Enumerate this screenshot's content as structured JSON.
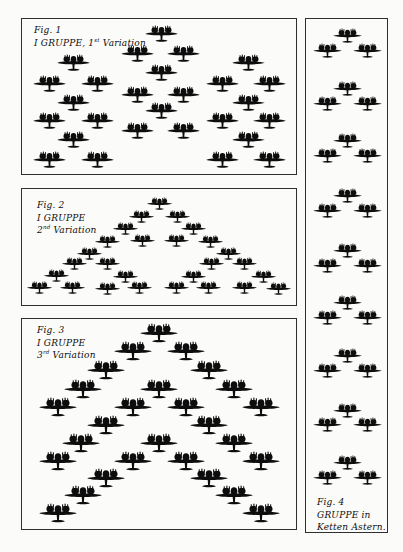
{
  "page": {
    "width": 403,
    "height": 552,
    "background": "#fbfbf9",
    "ink": "#0d0d0d",
    "box_border": "#2f2f2f"
  },
  "figures": [
    {
      "name": "fig-1-gruppe-1st-variation",
      "box": {
        "x": 21,
        "y": 18,
        "w": 276,
        "h": 157
      },
      "caption": {
        "x": 12,
        "y": 5,
        "line1": "Fig. 1",
        "line2_pre": "I GRUPPE, 1",
        "line2_sup": "st",
        "line2_post": " Variation"
      },
      "plane_width": 33,
      "planes": [
        [
          160,
          33
        ],
        [
          136,
          53
        ],
        [
          182,
          53
        ],
        [
          160,
          72
        ],
        [
          136,
          94
        ],
        [
          182,
          94
        ],
        [
          160,
          110
        ],
        [
          136,
          130
        ],
        [
          182,
          130
        ],
        [
          72,
          62
        ],
        [
          48,
          83
        ],
        [
          96,
          83
        ],
        [
          72,
          102
        ],
        [
          48,
          120
        ],
        [
          96,
          120
        ],
        [
          72,
          139
        ],
        [
          48,
          159
        ],
        [
          96,
          159
        ],
        [
          247,
          62
        ],
        [
          221,
          83
        ],
        [
          268,
          83
        ],
        [
          247,
          102
        ],
        [
          221,
          120
        ],
        [
          268,
          120
        ],
        [
          247,
          139
        ],
        [
          221,
          159
        ],
        [
          268,
          159
        ]
      ]
    },
    {
      "name": "fig-2-gruppe-2nd-variation",
      "box": {
        "x": 21,
        "y": 188,
        "w": 276,
        "h": 118
      },
      "caption": {
        "x": 15,
        "y": 10,
        "line1": "Fig. 2",
        "line2_pre": "I GRUPPE",
        "line3_pre": "2",
        "line3_sup": "nd",
        "line3_post": " Variation"
      },
      "plane_width": 25,
      "planes": [
        [
          158,
          203
        ],
        [
          140,
          216
        ],
        [
          176,
          216
        ],
        [
          124,
          228
        ],
        [
          192,
          228
        ],
        [
          106,
          241
        ],
        [
          141,
          240
        ],
        [
          175,
          240
        ],
        [
          209,
          241
        ],
        [
          88,
          253
        ],
        [
          227,
          253
        ],
        [
          73,
          263
        ],
        [
          106,
          263
        ],
        [
          210,
          263
        ],
        [
          243,
          263
        ],
        [
          55,
          275
        ],
        [
          124,
          276
        ],
        [
          192,
          276
        ],
        [
          262,
          276
        ],
        [
          38,
          287
        ],
        [
          71,
          287
        ],
        [
          106,
          288
        ],
        [
          138,
          287
        ],
        [
          175,
          287
        ],
        [
          207,
          287
        ],
        [
          243,
          287
        ],
        [
          277,
          288
        ]
      ]
    },
    {
      "name": "fig-3-gruppe-3rd-variation",
      "box": {
        "x": 21,
        "y": 318,
        "w": 276,
        "h": 212
      },
      "caption": {
        "x": 15,
        "y": 5,
        "line1": "Fig. 3",
        "line2_pre": "I GRUPPE",
        "line3_pre": "3",
        "line3_sup": "rd",
        "line3_post": " Variation"
      },
      "plane_width": 38,
      "planes": [
        [
          158,
          332
        ],
        [
          132,
          350
        ],
        [
          185,
          350
        ],
        [
          105,
          369
        ],
        [
          208,
          369
        ],
        [
          82,
          388
        ],
        [
          233,
          388
        ],
        [
          57,
          406
        ],
        [
          260,
          406
        ],
        [
          158,
          388
        ],
        [
          132,
          406
        ],
        [
          185,
          406
        ],
        [
          105,
          424
        ],
        [
          208,
          424
        ],
        [
          80,
          442
        ],
        [
          233,
          442
        ],
        [
          57,
          460
        ],
        [
          260,
          460
        ],
        [
          158,
          442
        ],
        [
          132,
          460
        ],
        [
          185,
          460
        ],
        [
          105,
          477
        ],
        [
          208,
          477
        ],
        [
          82,
          494
        ],
        [
          233,
          494
        ],
        [
          57,
          512
        ],
        [
          260,
          512
        ]
      ]
    },
    {
      "name": "fig-4-gruppe-in-ketten-astern",
      "box": {
        "x": 305,
        "y": 18,
        "w": 83,
        "h": 515
      },
      "caption": {
        "x": 11,
        "y": 477,
        "line1": "Fig. 4",
        "line2_pre": "GRUPPE in",
        "line3_pre": "Ketten Astern."
      },
      "plane_width": 29,
      "planes": [
        [
          346,
          35
        ],
        [
          326,
          50
        ],
        [
          366,
          50
        ],
        [
          346,
          88
        ],
        [
          326,
          103
        ],
        [
          366,
          103
        ],
        [
          346,
          140
        ],
        [
          326,
          155
        ],
        [
          366,
          155
        ],
        [
          346,
          195
        ],
        [
          326,
          210
        ],
        [
          366,
          210
        ],
        [
          346,
          250
        ],
        [
          326,
          265
        ],
        [
          366,
          265
        ],
        [
          346,
          302
        ],
        [
          326,
          317
        ],
        [
          366,
          317
        ],
        [
          346,
          355
        ],
        [
          326,
          370
        ],
        [
          366,
          370
        ],
        [
          346,
          410
        ],
        [
          326,
          424
        ],
        [
          366,
          424
        ],
        [
          346,
          462
        ],
        [
          326,
          477
        ],
        [
          366,
          477
        ]
      ]
    }
  ]
}
